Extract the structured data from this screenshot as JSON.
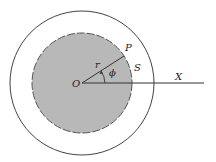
{
  "diagram": {
    "labels": {
      "origin": "O",
      "point": "P",
      "radius": "r",
      "angle": "ϕ",
      "region": "S",
      "axis": "X"
    },
    "colors": {
      "fill": "#b8b8b8",
      "stroke": "#333333",
      "background": "#ffffff"
    }
  }
}
